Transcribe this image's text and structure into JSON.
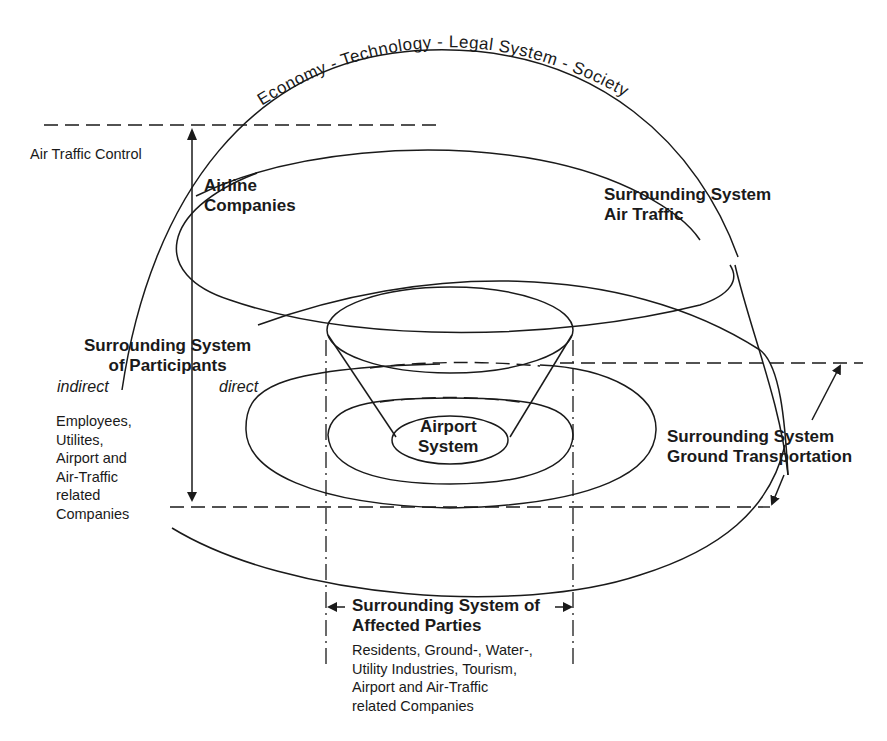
{
  "diagram": {
    "arc_label": "Economy - Technology - Legal System - Society",
    "air_traffic_control": "Air Traffic Control",
    "airline_companies": {
      "line1": "Airline",
      "line2": "Companies"
    },
    "surrounding_air_traffic": {
      "line1": "Surrounding System",
      "line2": "Air Traffic"
    },
    "participants": {
      "line1": "Surrounding System",
      "line2": "of Participants",
      "indirect_label": "indirect",
      "direct_label": "direct",
      "indirect_members": [
        "Employees,",
        "Utilites,",
        "Airport and",
        "Air-Traffic",
        "related",
        "Companies"
      ]
    },
    "airport_system": {
      "line1": "Airport",
      "line2": "System"
    },
    "ground_transportation": {
      "line1": "Surrounding System",
      "line2": "Ground Transportation"
    },
    "affected_parties": {
      "line1": "Surrounding System of",
      "line2": "Affected Parties",
      "members": [
        "Residents, Ground-, Water-,",
        "Utility Industries, Tourism,",
        "Airport and Air-Traffic",
        "related Companies"
      ]
    },
    "colors": {
      "ink": "#1a1a1a",
      "background": "#ffffff"
    }
  }
}
